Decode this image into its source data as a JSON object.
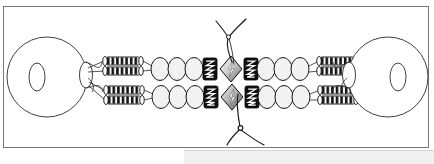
{
  "figure": {
    "caption": "",
    "background_color": "#ffffff",
    "frame": {
      "name": "figure-border",
      "x": 3,
      "y": 6,
      "width": 426,
      "height": 142,
      "stroke": "#5a5a5a",
      "stroke_width": 0.8,
      "fill": "#ffffff"
    },
    "bottom_strip": {
      "name": "page-bottom-strip",
      "color": "#f0f0f0",
      "border_color": "#d7d7d7"
    },
    "colors": {
      "outline": "#1a1a1a",
      "thin_outline": "#3c3c3c",
      "ellipse_fill": "#f2f2f2",
      "dark_block_fill": "#101010",
      "dark_block_glyph": "#ffffff",
      "diamond_fill_light": "#e8e8e8",
      "diamond_fill_dark": "#6e6e6e",
      "coil_fill": "#ffffff",
      "coil_bar": "#141414",
      "thread": "#1a1a1a",
      "sphere_fill": "#ffffff"
    },
    "spheres": [
      {
        "name": "left-sphere",
        "cx": 47,
        "cy": 77,
        "r": 40,
        "pore": {
          "cx": 39,
          "cy": 77,
          "rx": 8,
          "ry": 14
        },
        "neck": {
          "cx": 85,
          "cy": 77,
          "rx": 6,
          "ry": 13
        }
      },
      {
        "name": "right-sphere",
        "cx": 388,
        "cy": 77,
        "r": 40,
        "pore": {
          "cx": 396,
          "cy": 77,
          "rx": 8,
          "ry": 14
        },
        "neck": {
          "cx": 350,
          "cy": 77,
          "rx": 6,
          "ry": 13
        }
      }
    ],
    "arms": [
      {
        "name": "arm-upper-outer",
        "row": "upper",
        "offset": -12
      },
      {
        "name": "arm-upper-inner",
        "row": "upper",
        "offset": -2
      },
      {
        "name": "arm-lower-inner",
        "row": "lower",
        "offset": 8
      },
      {
        "name": "arm-lower-outer",
        "row": "lower",
        "offset": 18
      }
    ],
    "coil_segments": {
      "name": "coil-segment",
      "count_per_side": 4,
      "bars_per_coil": 7,
      "width": 34,
      "height": 8,
      "description": "hatched coiled-coil rod"
    },
    "bead_chains": {
      "name": "bead-chain",
      "beads_per_chain": 3,
      "bead_rx": 9,
      "bead_ry": 11,
      "fill": "#f2f2f2"
    },
    "dark_blocks": {
      "name": "dark-motor-block",
      "count": 4,
      "width": 14,
      "height": 22,
      "glyph": "zigzag"
    },
    "diamonds": {
      "name": "diamond-node",
      "count": 2,
      "half_width": 11,
      "half_height": 13,
      "glyph": "lightning-bolt"
    },
    "threads": [
      {
        "name": "thread-top",
        "description": "forked filament descending from top into center"
      },
      {
        "name": "thread-bottom",
        "description": "forked filament descending from center to bottom with node"
      }
    ],
    "thread_nodes": [
      {
        "name": "thread-node-top",
        "cx": 228,
        "cy": 37,
        "r": 2.1
      },
      {
        "name": "thread-node-bottom",
        "cx": 240,
        "cy": 128,
        "r": 2.4
      }
    ],
    "rows": {
      "upper_y": 69,
      "lower_y": 97
    }
  }
}
